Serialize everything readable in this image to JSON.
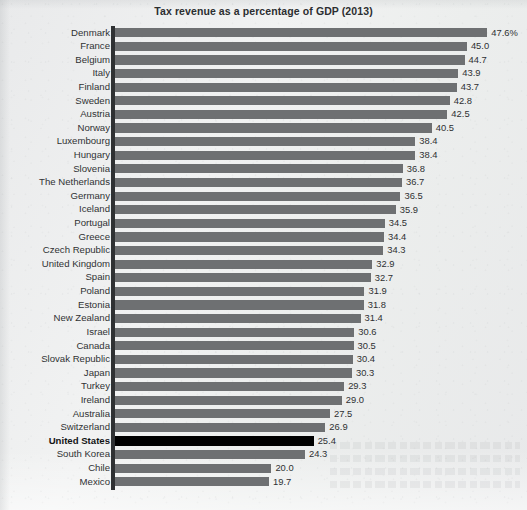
{
  "chart_data": {
    "type": "bar",
    "orientation": "horizontal",
    "title": "Tax revenue as a percentage of GDP (2013)",
    "xlabel": "",
    "ylabel": "",
    "xlim": [
      0,
      47.6
    ],
    "grid": false,
    "legend": null,
    "value_suffix_first_row": "%",
    "highlight": {
      "category": "United States",
      "color": "#000000",
      "bold_label": true
    },
    "bar_color": "#6e7072",
    "categories": [
      "Denmark",
      "France",
      "Belgium",
      "Italy",
      "Finland",
      "Sweden",
      "Austria",
      "Norway",
      "Luxembourg",
      "Hungary",
      "Slovenia",
      "The Netherlands",
      "Germany",
      "Iceland",
      "Portugal",
      "Greece",
      "Czech Republic",
      "United Kingdom",
      "Spain",
      "Poland",
      "Estonia",
      "New Zealand",
      "Israel",
      "Canada",
      "Slovak Republic",
      "Japan",
      "Turkey",
      "Ireland",
      "Australia",
      "Switzerland",
      "United States",
      "South Korea",
      "Chile",
      "Mexico"
    ],
    "values": [
      47.6,
      45.0,
      44.7,
      43.9,
      43.7,
      42.8,
      42.5,
      40.5,
      38.4,
      38.4,
      36.8,
      36.7,
      36.5,
      35.9,
      34.5,
      34.4,
      34.3,
      32.9,
      32.7,
      31.9,
      31.8,
      31.4,
      30.6,
      30.5,
      30.4,
      30.3,
      29.3,
      29.0,
      27.5,
      26.9,
      25.4,
      24.3,
      20.0,
      19.7
    ],
    "value_labels": [
      "47.6%",
      "45.0",
      "44.7",
      "43.9",
      "43.7",
      "42.8",
      "42.5",
      "40.5",
      "38.4",
      "38.4",
      "36.8",
      "36.7",
      "36.5",
      "35.9",
      "34.5",
      "34.4",
      "34.3",
      "32.9",
      "32.7",
      "31.9",
      "31.8",
      "31.4",
      "30.6",
      "30.5",
      "30.4",
      "30.3",
      "29.3",
      "29.0",
      "27.5",
      "26.9",
      "25.4",
      "24.3",
      "20.0",
      "19.7"
    ]
  }
}
